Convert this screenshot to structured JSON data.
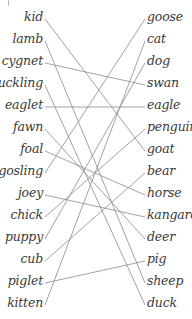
{
  "diagram": {
    "type": "matching",
    "left_items": [
      {
        "label": "kid",
        "y": 19
      },
      {
        "label": "lamb",
        "y": 41
      },
      {
        "label": "cygnet",
        "y": 63
      },
      {
        "label": "duckling",
        "y": 85
      },
      {
        "label": "eaglet",
        "y": 107
      },
      {
        "label": "fawn",
        "y": 129
      },
      {
        "label": "foal",
        "y": 151
      },
      {
        "label": "gosling",
        "y": 173
      },
      {
        "label": "joey",
        "y": 195
      },
      {
        "label": "chick",
        "y": 217
      },
      {
        "label": "puppy",
        "y": 239
      },
      {
        "label": "cub",
        "y": 261
      },
      {
        "label": "piglet",
        "y": 283
      },
      {
        "label": "kitten",
        "y": 305
      }
    ],
    "right_items": [
      {
        "label": "goose",
        "y": 19
      },
      {
        "label": "cat",
        "y": 41
      },
      {
        "label": "dog",
        "y": 63
      },
      {
        "label": "swan",
        "y": 85
      },
      {
        "label": "eagle",
        "y": 107
      },
      {
        "label": "penguin",
        "y": 129
      },
      {
        "label": "goat",
        "y": 151
      },
      {
        "label": "bear",
        "y": 173
      },
      {
        "label": "horse",
        "y": 195
      },
      {
        "label": "kangaroo",
        "y": 217
      },
      {
        "label": "deer",
        "y": 239
      },
      {
        "label": "pig",
        "y": 261
      },
      {
        "label": "sheep",
        "y": 283
      },
      {
        "label": "duck",
        "y": 305
      }
    ],
    "connections": [
      {
        "from": "kid",
        "to": "goat"
      },
      {
        "from": "lamb",
        "to": "sheep"
      },
      {
        "from": "cygnet",
        "to": "swan"
      },
      {
        "from": "duckling",
        "to": "duck"
      },
      {
        "from": "eaglet",
        "to": "eagle"
      },
      {
        "from": "fawn",
        "to": "deer"
      },
      {
        "from": "foal",
        "to": "horse"
      },
      {
        "from": "gosling",
        "to": "goose"
      },
      {
        "from": "joey",
        "to": "kangaroo"
      },
      {
        "from": "chick",
        "to": "penguin"
      },
      {
        "from": "puppy",
        "to": "dog"
      },
      {
        "from": "cub",
        "to": "bear"
      },
      {
        "from": "piglet",
        "to": "pig"
      },
      {
        "from": "kitten",
        "to": "cat"
      }
    ],
    "line_color": "#8a8a8a"
  }
}
